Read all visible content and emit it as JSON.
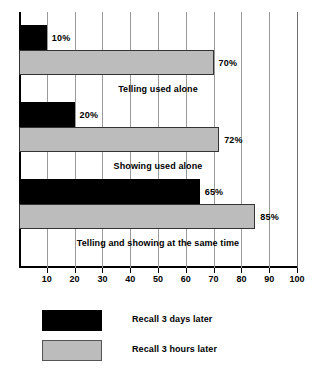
{
  "chart_data": {
    "type": "bar",
    "orientation": "horizontal",
    "title": "",
    "xlabel": "",
    "ylabel": "",
    "xlim": [
      0,
      100
    ],
    "xticks": [
      10,
      20,
      30,
      40,
      50,
      60,
      70,
      80,
      90,
      100
    ],
    "grid": true,
    "legend_position": "bottom-left",
    "categories": [
      "Telling used alone",
      "Showing used alone",
      "Telling and showing at the same time"
    ],
    "series": [
      {
        "name": "Recall 3 days later",
        "color": "#000000",
        "values": [
          10,
          20,
          65
        ],
        "value_labels": [
          "10%",
          "20%",
          "65%"
        ]
      },
      {
        "name": "Recall 3 hours later",
        "color": "#bcbcbc",
        "values": [
          70,
          72,
          85
        ],
        "value_labels": [
          "70%",
          "72%",
          "85%"
        ]
      }
    ]
  },
  "axis": {
    "tick_labels": [
      "10",
      "20",
      "30",
      "40",
      "50",
      "60",
      "70",
      "80",
      "90",
      "100"
    ]
  },
  "groups": [
    {
      "caption": "Telling used alone",
      "dark_value": 10,
      "dark_label": "10%",
      "light_value": 70,
      "light_label": "70%"
    },
    {
      "caption": "Showing used alone",
      "dark_value": 20,
      "dark_label": "20%",
      "light_value": 72,
      "light_label": "72%"
    },
    {
      "caption": "Telling and showing at the same time",
      "dark_value": 65,
      "dark_label": "65%",
      "light_value": 85,
      "light_label": "85%"
    }
  ],
  "legend": {
    "items": [
      {
        "label": "Recall 3 days later",
        "color": "#000000"
      },
      {
        "label": "Recall 3 hours later",
        "color": "#bcbcbc"
      }
    ]
  },
  "colors": {
    "dark_series": "#000000",
    "light_series": "#bcbcbc",
    "axis": "#000000",
    "gridline": "#9a9a9a",
    "background": "#ffffff"
  }
}
